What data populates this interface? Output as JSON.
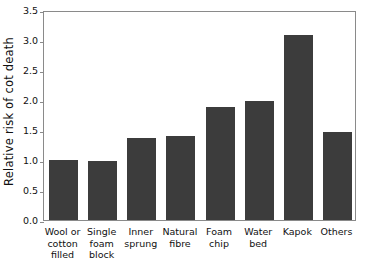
{
  "chart_data": {
    "type": "bar",
    "title": "",
    "xlabel": "",
    "ylabel": "Relative risk of cot death",
    "ylim": [
      0.0,
      3.5
    ],
    "yticks": [
      "0.0",
      "0.5",
      "1.0",
      "1.5",
      "2.0",
      "2.5",
      "3.0",
      "3.5"
    ],
    "ytick_values": [
      0.0,
      0.5,
      1.0,
      1.5,
      2.0,
      2.5,
      3.0,
      3.5
    ],
    "grid": false,
    "legend": false,
    "bar_color": "#3c3c3c",
    "categories": [
      "Wool or cotton filled",
      "Single foam block",
      "Inner sprung",
      "Natural fibre",
      "Foam chip",
      "Water bed",
      "Kapok",
      "Others"
    ],
    "category_lines": [
      [
        "Wool or",
        "cotton",
        "filled"
      ],
      [
        "Single",
        "foam",
        "block"
      ],
      [
        "Inner",
        "sprung"
      ],
      [
        "Natural",
        "fibre"
      ],
      [
        "Foam",
        "chip"
      ],
      [
        "Water",
        "bed"
      ],
      [
        "Kapok"
      ],
      [
        "Others"
      ]
    ],
    "values": [
      1.0,
      0.99,
      1.36,
      1.4,
      1.88,
      1.98,
      3.08,
      1.47
    ]
  }
}
